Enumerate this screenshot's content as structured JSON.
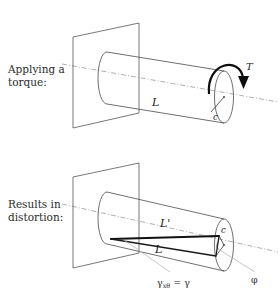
{
  "figure": {
    "background_color": "#ffffff",
    "line_color": "#4a4a4a",
    "axis_color": "#9a9a9a",
    "emphasis_color": "#111111"
  },
  "panels": [
    {
      "id": "top",
      "caption_line1": "Applying a",
      "caption_line2": "torque:",
      "labels": {
        "length": "L",
        "radius": "c",
        "torque": "T"
      },
      "icons": {
        "centerline": "dash-dot-axis-icon",
        "wall": "fixed-support-plane-icon",
        "shaft": "cylinder-icon",
        "torque_arrow": "curved-torque-arrow-icon"
      }
    },
    {
      "id": "bottom",
      "caption_line1": "Results in",
      "caption_line2": "distortion:",
      "labels": {
        "deformed_length": "L'",
        "original_length": "L",
        "radius": "c",
        "shear_strain": "γ",
        "shear_strain_subscript": "xθ",
        "shear_strain_equation_rhs": "γ",
        "equals": "=",
        "twist_angle": "φ"
      },
      "icons": {
        "centerline": "dash-dot-axis-icon",
        "wall": "fixed-support-plane-icon",
        "shaft": "cylinder-icon",
        "leader": "leader-line-icon",
        "twist_wedge": "twist-angle-wedge-icon"
      }
    }
  ]
}
